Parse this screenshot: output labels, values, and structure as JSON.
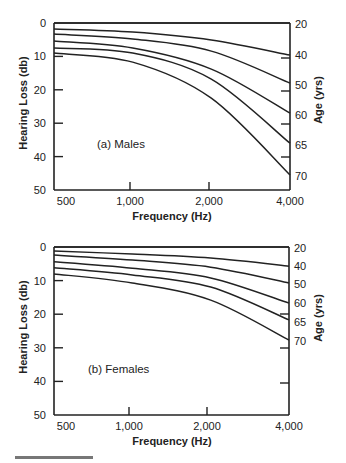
{
  "chart_data": [
    {
      "type": "line",
      "title": "(a) Males",
      "xlabel": "Frequency (Hz)",
      "ylabel": "Hearing Loss (db)",
      "y2label": "Age (yrs)",
      "x_ticks": [
        "500",
        "1,000",
        "2,000",
        "4,000"
      ],
      "x": [
        500,
        1000,
        2000,
        4000
      ],
      "y_ticks": [
        "0",
        "10",
        "20",
        "30",
        "40",
        "50"
      ],
      "ylim": [
        0,
        50
      ],
      "y_inverted": true,
      "grid": false,
      "legend_position": "right-axis labels",
      "series": [
        {
          "name": "20",
          "values": [
            0,
            0,
            0,
            0
          ]
        },
        {
          "name": "40",
          "values": [
            1.8,
            2.7,
            5.1,
            9.6
          ]
        },
        {
          "name": "50",
          "values": [
            3.3,
            4.8,
            8.4,
            18
          ]
        },
        {
          "name": "60",
          "values": [
            5.4,
            7.5,
            13.8,
            27
          ]
        },
        {
          "name": "65",
          "values": [
            7.5,
            9.0,
            16.8,
            36
          ]
        },
        {
          "name": "70",
          "values": [
            9.0,
            11.7,
            22.5,
            45.5
          ]
        }
      ]
    },
    {
      "type": "line",
      "title": "(b) Females",
      "xlabel": "Frequency (Hz)",
      "ylabel": "Hearing Loss (db)",
      "y2label": "Age (yrs)",
      "x_ticks": [
        "500",
        "1,000",
        "2,000",
        "4,000"
      ],
      "x": [
        500,
        1000,
        2000,
        4000
      ],
      "y_ticks": [
        "0",
        "10",
        "20",
        "30",
        "40",
        "50"
      ],
      "ylim": [
        0,
        50
      ],
      "y_inverted": true,
      "grid": false,
      "legend_position": "right-axis labels",
      "series": [
        {
          "name": "20",
          "values": [
            0,
            0,
            0,
            0
          ]
        },
        {
          "name": "40",
          "values": [
            1.2,
            2.1,
            3.3,
            5.7
          ]
        },
        {
          "name": "50",
          "values": [
            2.4,
            3.9,
            6.0,
            10.7
          ]
        },
        {
          "name": "60",
          "values": [
            4.4,
            6.3,
            9.2,
            16.7
          ]
        },
        {
          "name": "65",
          "values": [
            6.2,
            8.3,
            11.9,
            21.7
          ]
        },
        {
          "name": "70",
          "values": [
            8.0,
            10.7,
            15.8,
            27.7
          ]
        }
      ]
    }
  ],
  "panels": [
    {
      "label": "(a) Males",
      "ylabel": "Hearing Loss (db)",
      "xlabel": "Frequency (Hz)",
      "y2label": "Age (yrs)",
      "y_ticks": [
        "0",
        "10",
        "20",
        "30",
        "40",
        "50"
      ],
      "x_ticks": [
        "500",
        "1,000",
        "2,000",
        "4,000"
      ],
      "age_labels": [
        "20",
        "40",
        "50",
        "60",
        "65",
        "70"
      ]
    },
    {
      "label": "(b) Females",
      "ylabel": "Hearing Loss (db)",
      "xlabel": "Frequency (Hz)",
      "y2label": "Age (yrs)",
      "y_ticks": [
        "0",
        "10",
        "20",
        "30",
        "40",
        "50"
      ],
      "x_ticks": [
        "500",
        "1,000",
        "2,000",
        "4,000"
      ],
      "age_labels": [
        "20",
        "40",
        "50",
        "60",
        "65",
        "70"
      ]
    }
  ],
  "colors": {
    "ink": "#222222",
    "footer_rule": "#777777"
  }
}
